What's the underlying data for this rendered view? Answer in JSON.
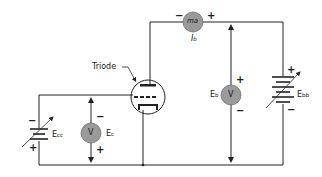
{
  "diagram": {
    "labels": {
      "triode": "Triode",
      "ammeter_symbol": "ma",
      "ammeter_label_main": "I",
      "ammeter_label_sub": "b",
      "plate_voltmeter_symbol": "V",
      "plate_voltage_main": "E",
      "plate_voltage_sub": "b",
      "grid_voltmeter_symbol": "V",
      "grid_voltage_main": "E",
      "grid_voltage_sub": "c",
      "plate_supply_main": "E",
      "plate_supply_sub": "bb",
      "grid_supply_main": "E",
      "grid_supply_sub": "cc"
    },
    "polarity": {
      "ammeter_left": "−",
      "ammeter_right": "+",
      "plate_voltmeter_top": "+",
      "plate_voltmeter_bottom": "−",
      "plate_supply_top": "+",
      "plate_supply_bottom": "−",
      "grid_voltmeter_top": "−",
      "grid_voltmeter_bottom": "+",
      "grid_supply_top": "−",
      "grid_supply_bottom": "+"
    },
    "colors": {
      "wire": "#222222",
      "meter_fill": "#9a9a9a",
      "meter_stroke": "#555555",
      "background": "#ffffff"
    }
  }
}
